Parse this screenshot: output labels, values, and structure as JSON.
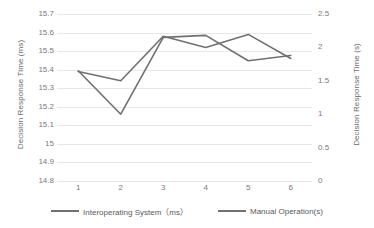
{
  "chart_data": {
    "type": "line",
    "title": "",
    "xlabel": "",
    "categories": [
      "1",
      "2",
      "3",
      "4",
      "5",
      "6"
    ],
    "grid": true,
    "legend_position": "bottom",
    "left_axis": {
      "label": "Decision Response Time (ms)",
      "ticks": [
        "15.7",
        "15.6",
        "15.5",
        "15.4",
        "15.3",
        "15.2",
        "15.1",
        "15",
        "14.9",
        "14.8"
      ],
      "lim": [
        14.8,
        15.7
      ]
    },
    "right_axis": {
      "label": "Decision Response Time (s)",
      "ticks": [
        "2.5",
        "2",
        "1.5",
        "1",
        "0.5",
        "0"
      ],
      "lim": [
        0,
        2.5
      ]
    },
    "series": [
      {
        "name": "Interoperating System（ms）",
        "axis": "left",
        "color": "#707070",
        "values": [
          15.39,
          15.34,
          15.58,
          15.52,
          15.59,
          15.46
        ]
      },
      {
        "name": "Manual Operation(s)",
        "axis": "right",
        "color": "#707070",
        "values": [
          1.65,
          1.0,
          2.15,
          2.18,
          1.8,
          1.88
        ]
      }
    ]
  },
  "legend": {
    "items": [
      {
        "label": "Interoperating System（ms）"
      },
      {
        "label": "Manual Operation(s)"
      }
    ]
  }
}
